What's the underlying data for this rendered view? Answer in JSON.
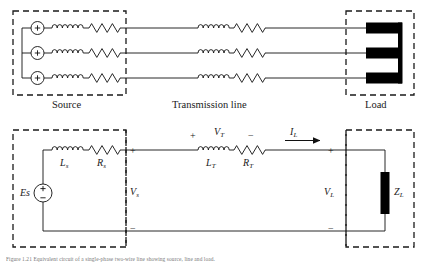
{
  "figure": {
    "kind": "circuit-diagram",
    "title_sections": {
      "source": "Source",
      "transmission_line": "Transmission line",
      "load": "Load"
    },
    "caption": "Figure 1.21   Equivalent circuit of a single-phase two-wire line showing source, line and load."
  },
  "top_diagram": {
    "name": "three-phase-one-line-pictorial",
    "phase_count": 3,
    "source_symbol": "+",
    "boxes": [
      {
        "name": "source-box",
        "label": "Source"
      },
      {
        "name": "load-box",
        "label": "Load"
      }
    ],
    "line_label": "Transmission line",
    "elements_per_phase": [
      "voltage-source",
      "inductor",
      "resistor",
      "line",
      "inductor",
      "resistor",
      "line",
      "load-bar"
    ]
  },
  "bottom_diagram": {
    "name": "single-phase-equivalent-circuit",
    "source": {
      "label": "Es",
      "plus": "+",
      "minus": "−"
    },
    "source_branch": {
      "inductor_label": "L",
      "inductor_sub": "s",
      "resistor_label": "R",
      "resistor_sub": "s"
    },
    "line_branch": {
      "inductor_label": "L",
      "inductor_sub": "T",
      "resistor_label": "R",
      "resistor_sub": "T"
    },
    "voltages": [
      {
        "name": "vs",
        "label": "V",
        "sub": "s",
        "plus": "+",
        "minus": "−"
      },
      {
        "name": "vt",
        "label": "V",
        "sub": "T",
        "plus": "+",
        "minus": "−"
      },
      {
        "name": "vl",
        "label": "V",
        "sub": "L",
        "plus": "+",
        "minus": "−"
      }
    ],
    "current": {
      "label": "I",
      "sub": "L",
      "direction": "right"
    },
    "load": {
      "label": "Z",
      "sub": "L"
    }
  },
  "colors": {
    "ink": "#111111",
    "dashed": "#1a1a1a",
    "load_fill": "#000000",
    "background": "#ffffff"
  }
}
